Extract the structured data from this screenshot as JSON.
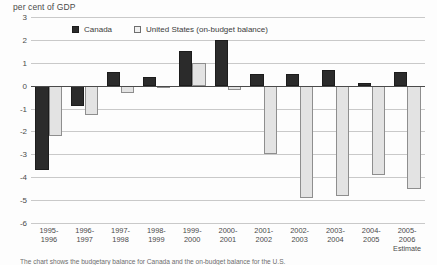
{
  "chart_data": {
    "type": "bar",
    "title": "per cent of GDP",
    "xlabel": "",
    "ylabel": "per cent of GDP",
    "ylim": [
      -6,
      3
    ],
    "yticks": [
      3,
      2,
      1,
      0,
      -1,
      -2,
      -3,
      -4,
      -5,
      -6
    ],
    "ytick_labels": [
      "3",
      "2",
      "1",
      "0",
      "-1",
      "-2",
      "-3",
      "-4",
      "-5",
      "-6"
    ],
    "grid": true,
    "legend_position": "top-left-inside",
    "categories": [
      "1995-\n1996",
      "1996-\n1997",
      "1997-\n1998",
      "1998-\n1999",
      "1999-\n2000",
      "2000-\n2001",
      "2001-\n2002",
      "2002-\n2003",
      "2003-\n2004",
      "2004-\n2005",
      "2005-\n2006"
    ],
    "category_lines": [
      [
        "1995-",
        "1996",
        ""
      ],
      [
        "1996-",
        "1997",
        ""
      ],
      [
        "1997-",
        "1998",
        ""
      ],
      [
        "1998-",
        "1999",
        ""
      ],
      [
        "1999-",
        "2000",
        ""
      ],
      [
        "2000-",
        "2001",
        ""
      ],
      [
        "2001-",
        "2002",
        ""
      ],
      [
        "2002-",
        "2003",
        ""
      ],
      [
        "2003-",
        "2004",
        ""
      ],
      [
        "2004-",
        "2005",
        ""
      ],
      [
        "2005-",
        "2006",
        "Estimate"
      ]
    ],
    "series": [
      {
        "name": "Canada",
        "color": "#2b2b2b",
        "values": [
          -3.7,
          -0.9,
          0.6,
          0.4,
          1.5,
          2.0,
          0.5,
          0.5,
          0.7,
          0.1,
          0.6
        ]
      },
      {
        "name": "United States (on-budget balance)",
        "color": "#e3e3e3",
        "values": [
          -2.2,
          -1.3,
          -0.3,
          0.0,
          1.0,
          -0.2,
          -3.0,
          -4.9,
          -4.8,
          -3.9,
          -4.5
        ]
      }
    ],
    "annotations": [
      "Estimate"
    ],
    "footnote": "The chart shows the budgetary balance for Canada and the on-budget balance for the U.S."
  },
  "legend": {
    "entries": [
      {
        "label": "Canada",
        "swatch": "canada-swatch"
      },
      {
        "label": "United States (on-budget balance)",
        "swatch": "united-states-swatch"
      }
    ]
  }
}
